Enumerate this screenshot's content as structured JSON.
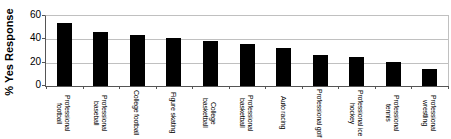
{
  "chart_data": {
    "type": "bar",
    "title": "",
    "ylabel": "% Yes Response",
    "xlabel": "",
    "ylim": [
      0,
      60
    ],
    "yticks": [
      0,
      20,
      40,
      60
    ],
    "grid": true,
    "legend": false,
    "bar_color": "#000000",
    "gridline_color": "#c0c0c0",
    "axis_color": "#555555",
    "categories": [
      "Professional football",
      "Professional baseball",
      "College football",
      "Figure skating",
      "College basketball",
      "Professional basketball",
      "Auto racing",
      "Professional golf",
      "Professional ice hockey",
      "Professional tennis",
      "Professional wrestling"
    ],
    "values": [
      54,
      46,
      44,
      41,
      39,
      36,
      33,
      27,
      25,
      21,
      15
    ]
  }
}
